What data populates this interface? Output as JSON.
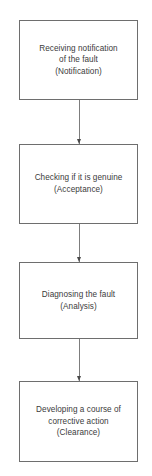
{
  "diagram": {
    "type": "flowchart",
    "orientation": "vertical-top-to-bottom",
    "background_color": "#ffffff",
    "box_border_color": "#6e6e6e",
    "connector_color": "#7d7d7d",
    "text_color": "#3b3b3b",
    "nodes": [
      {
        "id": "notification",
        "label": "Receiving notification\nof the fault\n(Notification)",
        "stage_name": "Notification",
        "x": 19,
        "y": 20,
        "width": 119,
        "height": 80
      },
      {
        "id": "acceptance",
        "label": "Checking if it is genuine\n(Acceptance)",
        "stage_name": "Acceptance",
        "x": 19,
        "y": 144,
        "width": 119,
        "height": 80
      },
      {
        "id": "analysis",
        "label": "Diagnosing the fault\n(Analysis)",
        "stage_name": "Analysis",
        "x": 19,
        "y": 262,
        "width": 119,
        "height": 77
      },
      {
        "id": "clearance",
        "label": "Developing a course of\ncorrective action\n(Clearance)",
        "stage_name": "Clearance",
        "x": 19,
        "y": 381,
        "width": 119,
        "height": 81
      }
    ],
    "connectors": [
      {
        "id": "notification-to-acceptance",
        "from": "notification",
        "to": "acceptance",
        "x": 79,
        "y_start": 100,
        "y_end": 144
      },
      {
        "id": "acceptance-to-analysis",
        "from": "acceptance",
        "to": "analysis",
        "x": 79,
        "y_start": 224,
        "y_end": 262
      },
      {
        "id": "analysis-to-clearance",
        "from": "analysis",
        "to": "clearance",
        "x": 79,
        "y_start": 339,
        "y_end": 381
      }
    ]
  }
}
